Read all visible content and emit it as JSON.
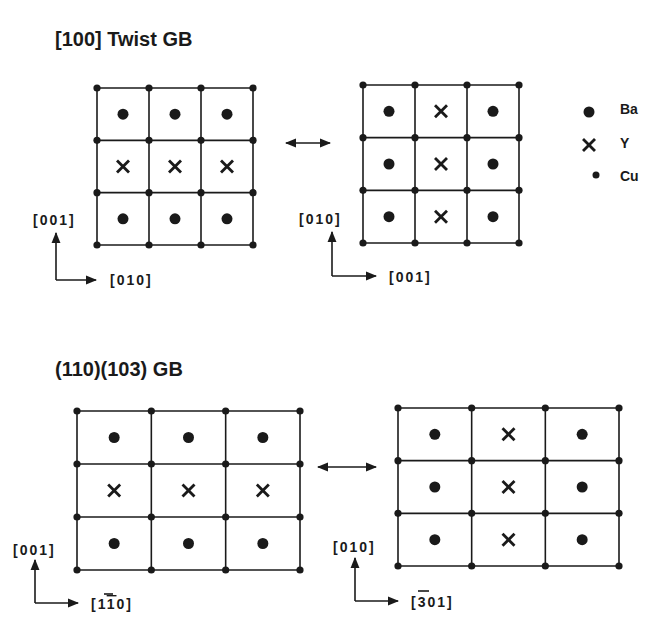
{
  "panels": [
    {
      "id": "twist",
      "title": "[100]  Twist  GB",
      "left_grid": {
        "x0": 97,
        "y0": 88,
        "x1": 253,
        "y1": 245,
        "cells": [
          [
            "Ba",
            "Ba",
            "Ba"
          ],
          [
            "Y",
            "Y",
            "Y"
          ],
          [
            "Ba",
            "Ba",
            "Ba"
          ]
        ],
        "axis_vertical": "[001]",
        "axis_horizontal": "[010]"
      },
      "right_grid": {
        "x0": 363,
        "y0": 85,
        "x1": 519,
        "y1": 243,
        "cells": [
          [
            "Ba",
            "Y",
            "Ba"
          ],
          [
            "Ba",
            "Y",
            "Ba"
          ],
          [
            "Ba",
            "Y",
            "Ba"
          ]
        ],
        "axis_vertical": "[010]",
        "axis_horizontal": "[001]"
      },
      "arrow": {
        "x0": 286,
        "x1": 330,
        "y": 143
      }
    },
    {
      "id": "tilt",
      "title": "(110)(103)   GB",
      "left_grid": {
        "x0": 77,
        "y0": 411,
        "x1": 300,
        "y1": 570,
        "cells": [
          [
            "Ba",
            "Ba",
            "Ba"
          ],
          [
            "Y",
            "Y",
            "Y"
          ],
          [
            "Ba",
            "Ba",
            "Ba"
          ]
        ],
        "axis_vertical": "[001]",
        "axis_horizontal": "[1",
        "axis_horizontal_overbar": "1",
        "axis_horizontal_tail": "0]"
      },
      "right_grid": {
        "x0": 398,
        "y0": 408,
        "x1": 619,
        "y1": 566,
        "cells": [
          [
            "Ba",
            "Y",
            "Ba"
          ],
          [
            "Ba",
            "Y",
            "Ba"
          ],
          [
            "Ba",
            "Y",
            "Ba"
          ]
        ],
        "axis_vertical": "[010]",
        "axis_horizontal": "[",
        "axis_horizontal_overbar": "3",
        "axis_horizontal_tail": "01]"
      },
      "arrow": {
        "x0": 318,
        "x1": 376,
        "y": 467
      }
    }
  ],
  "legend": {
    "items": [
      {
        "symbol": "large-dot",
        "label": "Ba"
      },
      {
        "symbol": "cross",
        "label": "Y"
      },
      {
        "symbol": "small-dot",
        "label": "Cu"
      }
    ]
  }
}
